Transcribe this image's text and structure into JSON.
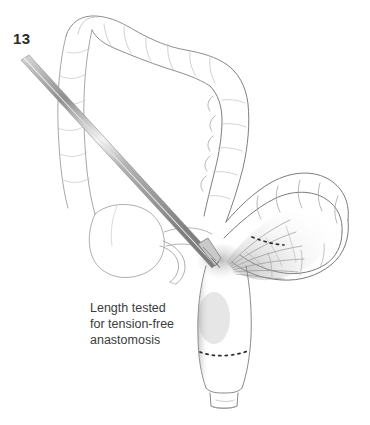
{
  "figure": {
    "number": "13",
    "type": "surgical-illustration",
    "background_color": "#ffffff",
    "ink_color": "#555555",
    "text_color": "#3c3c3c",
    "number_color": "#2b2b2b"
  },
  "caption": {
    "lines": [
      "Length tested",
      "for tension-free",
      "anastomosis"
    ]
  },
  "annotations": {
    "proximal_dashed_line": {
      "name": "proximal-resection-dashed-line",
      "description": "dashed transection marker across sigmoid near mesenteric root"
    },
    "distal_dashed_line": {
      "name": "distal-resection-dashed-line",
      "description": "dashed transection marker across rectal stump"
    }
  },
  "anatomy": [
    {
      "name": "transverse-colon",
      "label": "Transverse colon"
    },
    {
      "name": "ascending-colon",
      "label": "Ascending colon"
    },
    {
      "name": "descending-colon",
      "label": "Descending colon"
    },
    {
      "name": "cecum",
      "label": "Cecum"
    },
    {
      "name": "appendix",
      "label": "Appendix"
    },
    {
      "name": "sigmoid-colon",
      "label": "Sigmoid colon"
    },
    {
      "name": "mesentery",
      "label": "Mesentery"
    },
    {
      "name": "rectal-stump",
      "label": "Rectal stump"
    }
  ],
  "instrument": {
    "name": "surgical-clamp",
    "label": "Long surgical clamp / measuring instrument"
  }
}
